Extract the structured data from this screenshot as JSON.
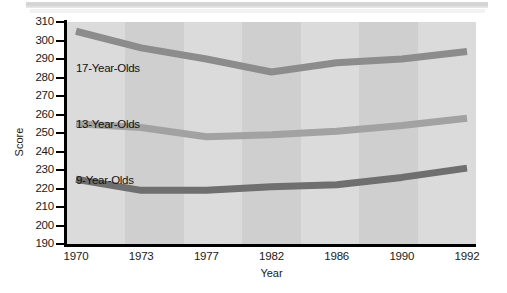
{
  "chart_data": {
    "type": "line",
    "title": "",
    "xlabel": "Year",
    "ylabel": "Score",
    "categories": [
      "1970",
      "1973",
      "1977",
      "1982",
      "1986",
      "1990",
      "1992"
    ],
    "ylim": [
      190,
      310
    ],
    "yticks": [
      190,
      200,
      210,
      220,
      230,
      240,
      250,
      260,
      270,
      280,
      290,
      300,
      310
    ],
    "grid": false,
    "legend_position": "inline-labels",
    "series": [
      {
        "name": "17-Year-Olds",
        "color": "#8c8c8c",
        "values": [
          305,
          296,
          290,
          283,
          288,
          290,
          294
        ]
      },
      {
        "name": "13-Year-Olds",
        "color": "#a2a2a2",
        "values": [
          255,
          253,
          248,
          249,
          251,
          254,
          258
        ]
      },
      {
        "name": "9-Year-Olds",
        "color": "#6f6f6f",
        "values": [
          225,
          219,
          219,
          221,
          222,
          226,
          231
        ]
      }
    ],
    "annotations": [
      {
        "text": "17-Year-Olds",
        "series": "17-Year-Olds"
      },
      {
        "text": "13-Year-Olds",
        "series": "13-Year-Olds"
      },
      {
        "text": "9-Year-Olds",
        "series": "9-Year-Olds"
      }
    ]
  },
  "axis": {
    "y_title": "Score",
    "x_title": "Year",
    "y_tick_labels": [
      "310",
      "300",
      "290",
      "280",
      "270",
      "260",
      "250",
      "240",
      "230",
      "220",
      "210",
      "200",
      "190"
    ],
    "x_tick_labels": [
      "1970",
      "1973",
      "1977",
      "1982",
      "1986",
      "1990",
      "1992"
    ]
  },
  "series_labels": {
    "s17": "17-Year-Olds",
    "s13": "13-Year-Olds",
    "s9": "9-Year-Olds"
  },
  "colors": {
    "plot_background": "#d7d7d7",
    "axis": "#000000",
    "line_17": "#8c8c8c",
    "line_13": "#a2a2a2",
    "line_9": "#6f6f6f"
  }
}
